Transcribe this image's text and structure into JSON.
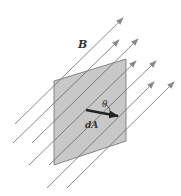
{
  "figure": {
    "field_label": "B",
    "angle_label": "θ",
    "area_label": "dA",
    "colors": {
      "plate_fill": "#c8c8c8",
      "plate_edge": "#707070",
      "field_lines": "#8a8a8a",
      "area_vector": "#222222"
    },
    "plate": {
      "points": "54,81 126,59 126,141 54,165"
    },
    "field_lines": [
      {
        "x1": 15,
        "y1": 124,
        "x2": 123,
        "y2": 18
      },
      {
        "x1": 13,
        "y1": 143,
        "x2": 119,
        "y2": 40
      },
      {
        "x1": 32,
        "y1": 143,
        "x2": 138,
        "y2": 39
      },
      {
        "x1": 29,
        "y1": 165,
        "x2": 136,
        "y2": 61
      },
      {
        "x1": 49,
        "y1": 165,
        "x2": 156,
        "y2": 61
      },
      {
        "x1": 47,
        "y1": 188,
        "x2": 154,
        "y2": 82
      },
      {
        "x1": 67,
        "y1": 188,
        "x2": 174,
        "y2": 82
      }
    ],
    "area_vector": {
      "x1": 86,
      "y1": 110,
      "x2": 118,
      "y2": 116
    }
  }
}
